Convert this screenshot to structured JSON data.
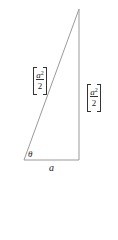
{
  "diagram": {
    "type": "right-triangle",
    "vertices": {
      "apex": [
        79,
        9
      ],
      "bottom_left": [
        24,
        160
      ],
      "bottom_right": [
        79,
        160
      ]
    },
    "labels": {
      "hypotenuse": {
        "numerator_base": "a",
        "numerator_exp": "2",
        "denominator": "2"
      },
      "vertical_side": {
        "numerator_base": "a",
        "numerator_exp": "2",
        "denominator": "2"
      },
      "angle": "θ",
      "base": "a"
    },
    "line_color": "#9a9a9a"
  }
}
